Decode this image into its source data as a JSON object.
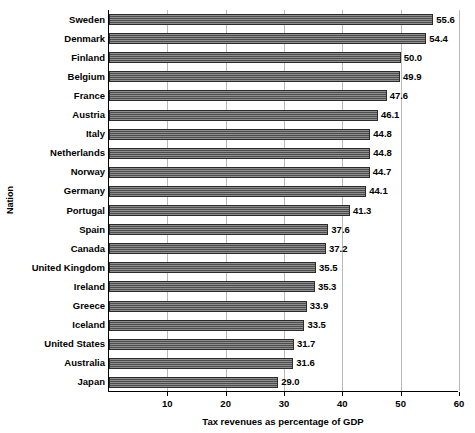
{
  "chart_data": {
    "type": "bar",
    "orientation": "horizontal",
    "title": "",
    "xlabel": "Tax revenues as percentage of GDP",
    "ylabel": "Nation",
    "xlim": [
      0,
      60
    ],
    "xticks": [
      10,
      20,
      30,
      40,
      50,
      60
    ],
    "grid": true,
    "legend": "none",
    "categories": [
      "Sweden",
      "Denmark",
      "Finland",
      "Belgium",
      "France",
      "Austria",
      "Italy",
      "Netherlands",
      "Norway",
      "Germany",
      "Portugal",
      "Spain",
      "Canada",
      "United Kingdom",
      "Ireland",
      "Greece",
      "Iceland",
      "United States",
      "Australia",
      "Japan"
    ],
    "values": [
      55.6,
      54.4,
      50.0,
      49.9,
      47.6,
      46.1,
      44.8,
      44.8,
      44.7,
      44.1,
      41.3,
      37.6,
      37.2,
      35.5,
      35.3,
      33.9,
      33.5,
      31.7,
      31.6,
      29.0
    ],
    "value_labels": [
      "55.6",
      "54.4",
      "50.0",
      "49.9",
      "47.6",
      "46.1",
      "44.8",
      "44.8",
      "44.7",
      "44.1",
      "41.3",
      "37.6",
      "37.2",
      "35.5",
      "35.3",
      "33.9",
      "33.5",
      "31.7",
      "31.6",
      "29.0"
    ],
    "bar_color": "#5e5e5e",
    "bar_edge_color": "#2b2b2b"
  }
}
